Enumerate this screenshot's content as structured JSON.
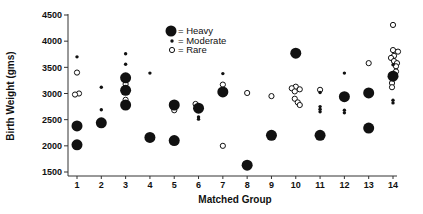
{
  "chart_data": {
    "type": "scatter",
    "title": "",
    "xlabel": "Matched Group",
    "ylabel": "Birth Weight (gms)",
    "xlim": [
      1,
      14
    ],
    "ylim": [
      1500,
      4500
    ],
    "grid": false,
    "x_ticks": [
      "1",
      "2",
      "3",
      "4",
      "5",
      "6",
      "7",
      "8",
      "9",
      "10",
      "11",
      "12",
      "13",
      "14"
    ],
    "y_ticks": [
      "1500",
      "2000",
      "2500",
      "3000",
      "3500",
      "4000",
      "4500"
    ],
    "legend_position": "top-center",
    "legend": [
      {
        "key": "heavy",
        "label": "= Heavy",
        "marker": "large filled circle"
      },
      {
        "key": "moderate",
        "label": "= Moderate",
        "marker": "small filled dot"
      },
      {
        "key": "rare",
        "label": "= Rare",
        "marker": "small open circle"
      }
    ],
    "series": [
      {
        "name": "Heavy",
        "marker": "heavy",
        "points": [
          {
            "x": 1,
            "y": 2380
          },
          {
            "x": 1,
            "y": 2020
          },
          {
            "x": 2,
            "y": 2440
          },
          {
            "x": 3,
            "y": 3300
          },
          {
            "x": 3,
            "y": 3060
          },
          {
            "x": 3,
            "y": 2780
          },
          {
            "x": 4,
            "y": 2160
          },
          {
            "x": 5,
            "y": 2780
          },
          {
            "x": 5,
            "y": 2100
          },
          {
            "x": 6,
            "y": 2720
          },
          {
            "x": 7,
            "y": 3030
          },
          {
            "x": 8,
            "y": 1630
          },
          {
            "x": 9,
            "y": 2200
          },
          {
            "x": 10,
            "y": 3770
          },
          {
            "x": 11,
            "y": 2200
          },
          {
            "x": 12,
            "y": 2940
          },
          {
            "x": 13,
            "y": 3010
          },
          {
            "x": 13,
            "y": 2340
          },
          {
            "x": 14,
            "y": 3330
          }
        ]
      },
      {
        "name": "Moderate",
        "marker": "moderate",
        "points": [
          {
            "x": 1,
            "y": 3700
          },
          {
            "x": 2,
            "y": 3120
          },
          {
            "x": 2,
            "y": 2690
          },
          {
            "x": 3,
            "y": 3760
          },
          {
            "x": 3,
            "y": 3560
          },
          {
            "x": 4,
            "y": 3390
          },
          {
            "x": 6,
            "y": 2550
          },
          {
            "x": 6,
            "y": 2510
          },
          {
            "x": 7,
            "y": 3380
          },
          {
            "x": 11,
            "y": 3020
          },
          {
            "x": 11,
            "y": 2750
          },
          {
            "x": 11,
            "y": 2700
          },
          {
            "x": 11,
            "y": 2650
          },
          {
            "x": 12,
            "y": 3390
          },
          {
            "x": 12,
            "y": 2680
          },
          {
            "x": 12,
            "y": 2630
          },
          {
            "x": 14,
            "y": 3550
          },
          {
            "x": 14,
            "y": 3400
          },
          {
            "x": 14,
            "y": 2870
          },
          {
            "x": 14,
            "y": 2820
          }
        ]
      },
      {
        "name": "Rare",
        "marker": "rare",
        "points": [
          {
            "x": 1,
            "y": 3400
          },
          {
            "x": 1,
            "y": 3000,
            "dx": 2
          },
          {
            "x": 1,
            "y": 2980,
            "dx": -2
          },
          {
            "x": 3,
            "y": 3180
          },
          {
            "x": 3,
            "y": 2880
          },
          {
            "x": 5,
            "y": 2680
          },
          {
            "x": 6,
            "y": 2800,
            "dx": -3
          },
          {
            "x": 7,
            "y": 3170
          },
          {
            "x": 7,
            "y": 2000
          },
          {
            "x": 8,
            "y": 3010
          },
          {
            "x": 9,
            "y": 2950
          },
          {
            "x": 10,
            "y": 3130
          },
          {
            "x": 10,
            "y": 3100,
            "dx": -4
          },
          {
            "x": 10,
            "y": 3080,
            "dx": 4
          },
          {
            "x": 10,
            "y": 3040,
            "dx": -1
          },
          {
            "x": 10,
            "y": 2900,
            "dx": -1
          },
          {
            "x": 10,
            "y": 2830,
            "dx": 2
          },
          {
            "x": 10,
            "y": 2780,
            "dx": 4
          },
          {
            "x": 11,
            "y": 3070
          },
          {
            "x": 13,
            "y": 3580
          },
          {
            "x": 14,
            "y": 4310
          },
          {
            "x": 14,
            "y": 3830
          },
          {
            "x": 14,
            "y": 3800,
            "dx": 5
          },
          {
            "x": 14,
            "y": 3720,
            "dx": 1
          },
          {
            "x": 14,
            "y": 3680,
            "dx": -2
          },
          {
            "x": 14,
            "y": 3620,
            "dx": 1
          },
          {
            "x": 14,
            "y": 3580,
            "dx": 4
          },
          {
            "x": 14,
            "y": 3520,
            "dx": 3
          },
          {
            "x": 14,
            "y": 3420,
            "dx": 3
          },
          {
            "x": 14,
            "y": 3200,
            "dx": -1
          },
          {
            "x": 14,
            "y": 3120,
            "dx": -1
          }
        ]
      }
    ],
    "colors": {
      "ink": "#111111",
      "background": "#ffffff"
    }
  }
}
